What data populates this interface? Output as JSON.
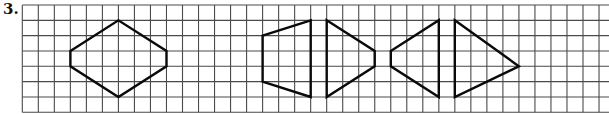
{
  "problem": {
    "number_label": "3."
  },
  "grid": {
    "origin_x": 22.3,
    "origin_y": 5,
    "cell_w": 16.02,
    "cell_h": 15.33,
    "columns": 36,
    "rows": 7,
    "right_edge": 609,
    "line_color": "#4a4a4a"
  },
  "shapes": [
    {
      "name": "hexagon",
      "points": [
        [
          3,
          3
        ],
        [
          6,
          1
        ],
        [
          9,
          3
        ],
        [
          9,
          4
        ],
        [
          6,
          6
        ],
        [
          3,
          4
        ]
      ]
    },
    {
      "name": "left-trapezoid-1",
      "points": [
        [
          15,
          2
        ],
        [
          18,
          1
        ],
        [
          18,
          6
        ],
        [
          15,
          5
        ]
      ]
    },
    {
      "name": "right-pentagon-1",
      "points": [
        [
          19,
          1
        ],
        [
          22,
          3
        ],
        [
          22,
          4
        ],
        [
          19,
          6
        ]
      ]
    },
    {
      "name": "left-quad-2",
      "points": [
        [
          23,
          3
        ],
        [
          26,
          1
        ],
        [
          26,
          6
        ],
        [
          23,
          4
        ]
      ]
    },
    {
      "name": "right-triangle-2",
      "points": [
        [
          27,
          1
        ],
        [
          31,
          4
        ],
        [
          27,
          6
        ]
      ]
    }
  ],
  "shape_color": "#0a0a0a"
}
